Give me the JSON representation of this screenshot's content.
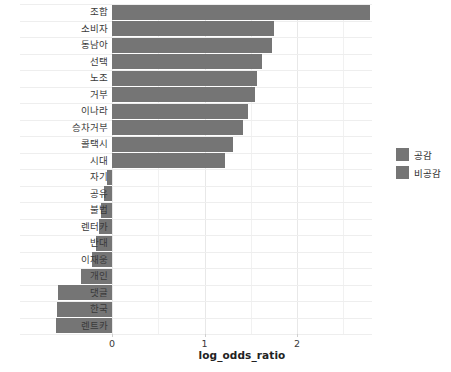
{
  "chart_data": {
    "type": "bar",
    "orientation": "horizontal",
    "title": "",
    "xlabel": "log_odds_ratio",
    "ylabel": "",
    "xlim": [
      -0.75,
      2.95
    ],
    "xticks": [
      0,
      1,
      2
    ],
    "xtick_labels": [
      "0",
      "1",
      "2"
    ],
    "grid": true,
    "legend_position": "right",
    "bar_color": "#757575",
    "categories": [
      "조합",
      "소비자",
      "동남아",
      "선택",
      "노조",
      "거부",
      "이나라",
      "승차거부",
      "콜택시",
      "시대",
      "자기",
      "공유",
      "불법",
      "렌터카",
      "반대",
      "이재웅",
      "개인",
      "댓글",
      "한국",
      "렌트카"
    ],
    "values": [
      2.79,
      1.75,
      1.73,
      1.62,
      1.57,
      1.55,
      1.47,
      1.42,
      1.31,
      1.22,
      -0.05,
      -0.09,
      -0.12,
      -0.14,
      -0.17,
      -0.22,
      -0.33,
      -0.58,
      -0.6,
      -0.61
    ],
    "legend": [
      {
        "label": "공감",
        "color": "#757575"
      },
      {
        "label": "비공감",
        "color": "#757575"
      }
    ]
  }
}
